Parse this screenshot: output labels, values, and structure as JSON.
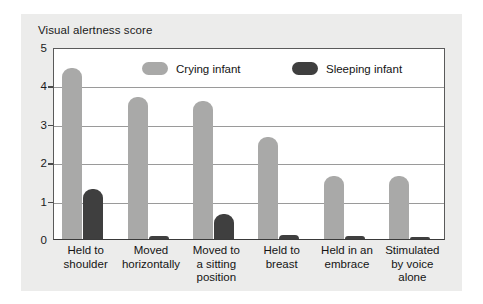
{
  "chart_data": {
    "type": "bar",
    "title": "Visual alertness score",
    "xlabel": "",
    "ylabel": "Visual alertness score",
    "ylim": [
      0,
      5
    ],
    "yticks": [
      "0",
      "1",
      "2",
      "3",
      "4",
      "5"
    ],
    "grid": true,
    "legend_position": "inside-top",
    "categories": [
      "Held to shoulder",
      "Moved horizontally",
      "Moved to a sitting position",
      "Held to breast",
      "Held in an embrace",
      "Stimulated by voice alone"
    ],
    "category_lines": [
      [
        "Held to",
        "shoulder"
      ],
      [
        "Moved",
        "horizontally"
      ],
      [
        "Moved to",
        "a sitting",
        "position"
      ],
      [
        "Held to",
        "breast"
      ],
      [
        "Held in an",
        "embrace"
      ],
      [
        "Stimulated",
        "by voice",
        "alone"
      ]
    ],
    "series": [
      {
        "name": "Crying infant",
        "color": "#a9a9a8",
        "values": [
          4.45,
          3.7,
          3.6,
          2.65,
          1.65,
          1.65
        ]
      },
      {
        "name": "Sleeping infant",
        "color": "#3f3f3f",
        "values": [
          1.3,
          0.08,
          0.65,
          0.1,
          0.08,
          0.06
        ]
      }
    ]
  },
  "colors": {
    "panel_background": "#ececeb",
    "plot_background": "#ffffff",
    "axis": "#4a4a4a",
    "gridline": "#9a9a9a",
    "crying": "#a9a9a8",
    "sleeping": "#3f3f3f",
    "text": "#141414"
  }
}
